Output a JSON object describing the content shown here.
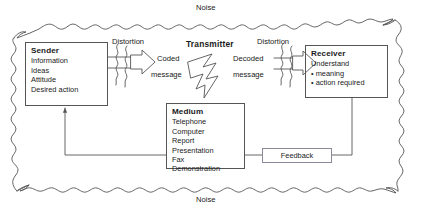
{
  "diagram": {
    "noise_top_label": "Noise",
    "noise_bottom_label": "Noise",
    "colors": {
      "line": "#555555",
      "text": "#1a1a1a",
      "feedback_border": "#8a8a9a",
      "background": "#ffffff"
    },
    "boxes": [
      {
        "id": "sender",
        "title": "Sender",
        "items": [
          "Information",
          "Ideas",
          "Attitude",
          "Desired action"
        ],
        "bulleted": false
      },
      {
        "id": "medium",
        "title": "Medium",
        "items": [
          "Telephone",
          "Computer",
          "Report",
          "Presentation",
          "Fax",
          "Demonstration"
        ],
        "bulleted": false
      },
      {
        "id": "receiver",
        "title": "Receiver",
        "items": [
          "Understand",
          "meaning",
          "action required"
        ],
        "bulleted": false
      }
    ],
    "labels": {
      "distortion_left": "Distortion",
      "distortion_right": "Distortion",
      "coded_message_line1": "Coded",
      "coded_message_line2": "message",
      "decoded_message_line1": "Decoded",
      "decoded_message_line2": "message",
      "transmitter": "Transmitter",
      "feedback": "Feedback"
    },
    "receiver_detail": {
      "understand": "Understand",
      "bullets": [
        "meaning",
        "action required"
      ]
    }
  }
}
